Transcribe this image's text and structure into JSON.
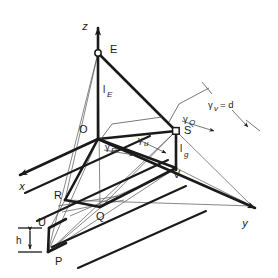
{
  "figure": {
    "type": "3d-geometric-projection-diagram",
    "background_color": "#ffffff",
    "stroke_color": "#1a1a1a",
    "thin_stroke_color": "#4a4a4a"
  },
  "axes": [
    {
      "name": "z",
      "label": "z",
      "direction": "up"
    },
    {
      "name": "x",
      "label": "x",
      "direction": "lower-left"
    },
    {
      "name": "y",
      "label": "y",
      "direction": "lower-right"
    }
  ],
  "points": [
    {
      "name": "E",
      "label": "E",
      "marker": "circle"
    },
    {
      "name": "O",
      "label": "O",
      "marker": "none"
    },
    {
      "name": "S",
      "label": "S",
      "marker": "square"
    },
    {
      "name": "V",
      "label": "V",
      "marker": "none"
    },
    {
      "name": "R",
      "label": "R",
      "marker": "none"
    },
    {
      "name": "Q",
      "label": "Q",
      "marker": "none"
    },
    {
      "name": "U",
      "label": "U",
      "marker": "none"
    },
    {
      "name": "P",
      "label": "P",
      "marker": "none"
    }
  ],
  "lengths": [
    {
      "name": "l_E",
      "base": "l",
      "sub": "E"
    },
    {
      "name": "l_g",
      "base": "l",
      "sub": "g"
    },
    {
      "name": "h",
      "base": "h",
      "sub": ""
    }
  ],
  "gammas": [
    {
      "name": "gamma_R",
      "base": "γ",
      "sub": "R"
    },
    {
      "name": "gamma_u",
      "base": "γ",
      "sub": "u"
    },
    {
      "name": "gamma_Q",
      "base": "γ",
      "sub": "Q"
    },
    {
      "name": "gamma_v",
      "base": "γ",
      "sub": "v",
      "equals": "= d"
    }
  ],
  "annotations": {
    "gamma_v_equation": "= d"
  }
}
